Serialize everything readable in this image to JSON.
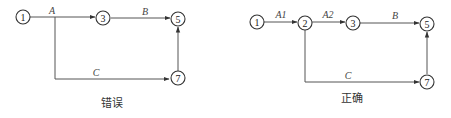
{
  "diagrams": [
    {
      "caption": "错误",
      "nodes": [
        {
          "id": "1",
          "label": "1"
        },
        {
          "id": "3",
          "label": "3"
        },
        {
          "id": "5",
          "label": "5"
        },
        {
          "id": "7",
          "label": "7"
        }
      ],
      "edges": [
        {
          "from": "1",
          "to": "3",
          "label": "A"
        },
        {
          "from": "3",
          "to": "5",
          "label": "B"
        },
        {
          "from": "A-branch",
          "to": "7",
          "label": "C"
        },
        {
          "from": "7",
          "to": "5",
          "label": ""
        }
      ]
    },
    {
      "caption": "正确",
      "nodes": [
        {
          "id": "1",
          "label": "1"
        },
        {
          "id": "2",
          "label": "2"
        },
        {
          "id": "3",
          "label": "3"
        },
        {
          "id": "5",
          "label": "5"
        },
        {
          "id": "7",
          "label": "7"
        }
      ],
      "edges": [
        {
          "from": "1",
          "to": "2",
          "label": "A1"
        },
        {
          "from": "2",
          "to": "3",
          "label": "A2"
        },
        {
          "from": "3",
          "to": "5",
          "label": "B"
        },
        {
          "from": "2",
          "to": "7",
          "label": "C"
        },
        {
          "from": "7",
          "to": "5",
          "label": ""
        }
      ]
    }
  ]
}
